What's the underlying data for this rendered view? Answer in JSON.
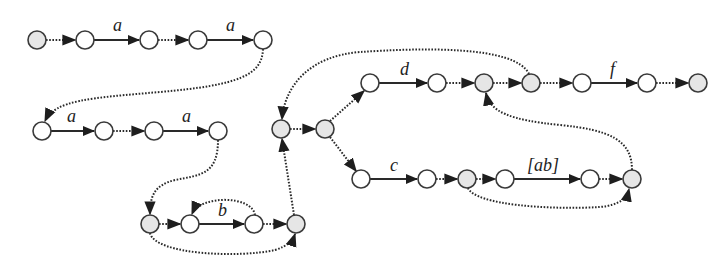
{
  "diagram": {
    "type": "automaton / NFA state graph",
    "colors": {
      "node_fill_plain": "#ffffff",
      "node_fill_shaded": "#e6e6e6",
      "stroke": "#2a2a2a"
    },
    "nodes": [
      {
        "id": "n1",
        "x": 37,
        "y": 40,
        "shaded": true
      },
      {
        "id": "n2",
        "x": 85,
        "y": 40,
        "shaded": false
      },
      {
        "id": "n3",
        "x": 149,
        "y": 40,
        "shaded": false
      },
      {
        "id": "n4",
        "x": 198,
        "y": 40,
        "shaded": false
      },
      {
        "id": "n5",
        "x": 263,
        "y": 40,
        "shaded": false
      },
      {
        "id": "n6",
        "x": 42,
        "y": 131,
        "shaded": false
      },
      {
        "id": "n7",
        "x": 104,
        "y": 131,
        "shaded": false
      },
      {
        "id": "n8",
        "x": 154,
        "y": 131,
        "shaded": false
      },
      {
        "id": "n9",
        "x": 218,
        "y": 131,
        "shaded": false
      },
      {
        "id": "n10",
        "x": 150,
        "y": 224,
        "shaded": true
      },
      {
        "id": "n11",
        "x": 190,
        "y": 224,
        "shaded": false
      },
      {
        "id": "n12",
        "x": 254,
        "y": 224,
        "shaded": false
      },
      {
        "id": "n13",
        "x": 296,
        "y": 224,
        "shaded": true
      },
      {
        "id": "n14",
        "x": 281,
        "y": 129,
        "shaded": true
      },
      {
        "id": "n15",
        "x": 325,
        "y": 129,
        "shaded": true
      },
      {
        "id": "n16",
        "x": 370,
        "y": 83,
        "shaded": false
      },
      {
        "id": "n17",
        "x": 437,
        "y": 83,
        "shaded": false
      },
      {
        "id": "n18",
        "x": 484,
        "y": 83,
        "shaded": true
      },
      {
        "id": "n19",
        "x": 531,
        "y": 83,
        "shaded": true
      },
      {
        "id": "n20",
        "x": 582,
        "y": 83,
        "shaded": false
      },
      {
        "id": "n21",
        "x": 647,
        "y": 83,
        "shaded": false
      },
      {
        "id": "n22",
        "x": 698,
        "y": 83,
        "shaded": true
      },
      {
        "id": "n23",
        "x": 361,
        "y": 179,
        "shaded": false
      },
      {
        "id": "n24",
        "x": 427,
        "y": 179,
        "shaded": false
      },
      {
        "id": "n25",
        "x": 467,
        "y": 179,
        "shaded": true
      },
      {
        "id": "n26",
        "x": 505,
        "y": 179,
        "shaded": false
      },
      {
        "id": "n27",
        "x": 590,
        "y": 179,
        "shaded": false
      },
      {
        "id": "n28",
        "x": 632,
        "y": 179,
        "shaded": true
      }
    ],
    "edges": [
      {
        "from": "n1",
        "to": "n2",
        "style": "epsilon"
      },
      {
        "from": "n2",
        "to": "n3",
        "style": "symbol",
        "label": "a"
      },
      {
        "from": "n3",
        "to": "n4",
        "style": "epsilon"
      },
      {
        "from": "n4",
        "to": "n5",
        "style": "symbol",
        "label": "a"
      },
      {
        "from": "n5",
        "to": "n6",
        "style": "epsilon"
      },
      {
        "from": "n6",
        "to": "n7",
        "style": "symbol",
        "label": "a"
      },
      {
        "from": "n7",
        "to": "n8",
        "style": "epsilon"
      },
      {
        "from": "n8",
        "to": "n9",
        "style": "symbol",
        "label": "a"
      },
      {
        "from": "n9",
        "to": "n10",
        "style": "epsilon"
      },
      {
        "from": "n10",
        "to": "n11",
        "style": "epsilon"
      },
      {
        "from": "n11",
        "to": "n12",
        "style": "symbol",
        "label": "b"
      },
      {
        "from": "n12",
        "to": "n13",
        "style": "epsilon"
      },
      {
        "from": "n12",
        "to": "n11",
        "style": "epsilon"
      },
      {
        "from": "n10",
        "to": "n13",
        "style": "epsilon"
      },
      {
        "from": "n13",
        "to": "n14",
        "style": "epsilon"
      },
      {
        "from": "n14",
        "to": "n15",
        "style": "epsilon"
      },
      {
        "from": "n15",
        "to": "n16",
        "style": "epsilon"
      },
      {
        "from": "n16",
        "to": "n17",
        "style": "symbol",
        "label": "d"
      },
      {
        "from": "n17",
        "to": "n18",
        "style": "epsilon"
      },
      {
        "from": "n18",
        "to": "n19",
        "style": "epsilon"
      },
      {
        "from": "n19",
        "to": "n14",
        "style": "epsilon"
      },
      {
        "from": "n19",
        "to": "n20",
        "style": "epsilon"
      },
      {
        "from": "n20",
        "to": "n21",
        "style": "symbol",
        "label": "f"
      },
      {
        "from": "n21",
        "to": "n22",
        "style": "epsilon"
      },
      {
        "from": "n15",
        "to": "n23",
        "style": "epsilon"
      },
      {
        "from": "n23",
        "to": "n24",
        "style": "symbol",
        "label": "c"
      },
      {
        "from": "n24",
        "to": "n25",
        "style": "epsilon"
      },
      {
        "from": "n25",
        "to": "n26",
        "style": "epsilon"
      },
      {
        "from": "n26",
        "to": "n27",
        "style": "symbol",
        "label": "[ab]"
      },
      {
        "from": "n27",
        "to": "n28",
        "style": "epsilon"
      },
      {
        "from": "n25",
        "to": "n28",
        "style": "epsilon"
      },
      {
        "from": "n28",
        "to": "n18",
        "style": "epsilon"
      }
    ],
    "labels": {
      "a1": "a",
      "a2": "a",
      "a3": "a",
      "a4": "a",
      "b": "b",
      "c": "c",
      "d": "d",
      "f": "f",
      "ab": "[ab]"
    }
  }
}
